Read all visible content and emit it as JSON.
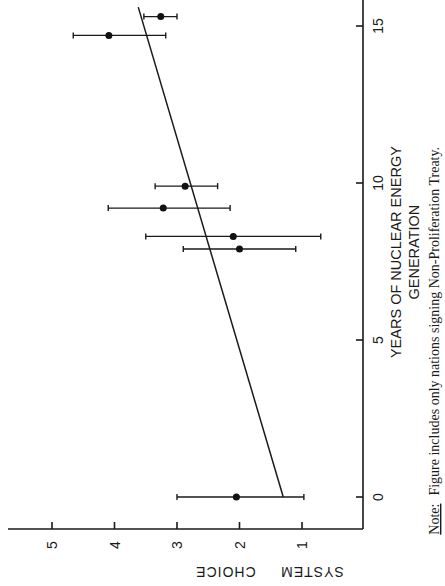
{
  "chart_data": {
    "type": "scatter",
    "title": "",
    "xlabel": "YEARS OF NUCLEAR ENERGY GENERATION",
    "xlabel_lines": [
      "YEARS   OF   NUCLEAR   ENERGY",
      "GENERATION"
    ],
    "ylabel": "SYSTEM CHOICE",
    "ylabel_words": [
      "SYSTEM",
      "CHOICE"
    ],
    "xlim": [
      0,
      15.6
    ],
    "ylim": [
      0.6,
      5.3
    ],
    "xticks": [
      0,
      5,
      10,
      15
    ],
    "xtick_labels": [
      "0",
      "5",
      "10",
      "15"
    ],
    "yticks": [
      1,
      2,
      3,
      4,
      5
    ],
    "ytick_labels": [
      "1",
      "2",
      "3",
      "4",
      "5"
    ],
    "grid": false,
    "series": [
      {
        "name": "Nations (mean with error bars)",
        "points": [
          {
            "x": 0.0,
            "y": 2.05,
            "err_low": 0.97,
            "err_high": 3.0
          },
          {
            "x": 7.9,
            "y": 2.0,
            "err_low": 1.1,
            "err_high": 2.9
          },
          {
            "x": 8.3,
            "y": 2.1,
            "err_low": 0.7,
            "err_high": 3.5
          },
          {
            "x": 9.2,
            "y": 3.22,
            "err_low": 2.15,
            "err_high": 4.1
          },
          {
            "x": 9.9,
            "y": 2.87,
            "err_low": 2.35,
            "err_high": 3.35
          },
          {
            "x": 14.7,
            "y": 4.09,
            "err_low": 3.18,
            "err_high": 4.66
          },
          {
            "x": 15.3,
            "y": 3.26,
            "err_low": 3.0,
            "err_high": 3.53
          }
        ]
      }
    ],
    "regression_line": {
      "x0": 0.0,
      "y0": 1.3,
      "x1": 15.6,
      "y1": 3.62
    },
    "note_label": "Note:",
    "note_text": "Figure includes only nations signing Non-Proliferation Treaty.",
    "orientation": "rotated 90° counter-clockwise on page"
  }
}
